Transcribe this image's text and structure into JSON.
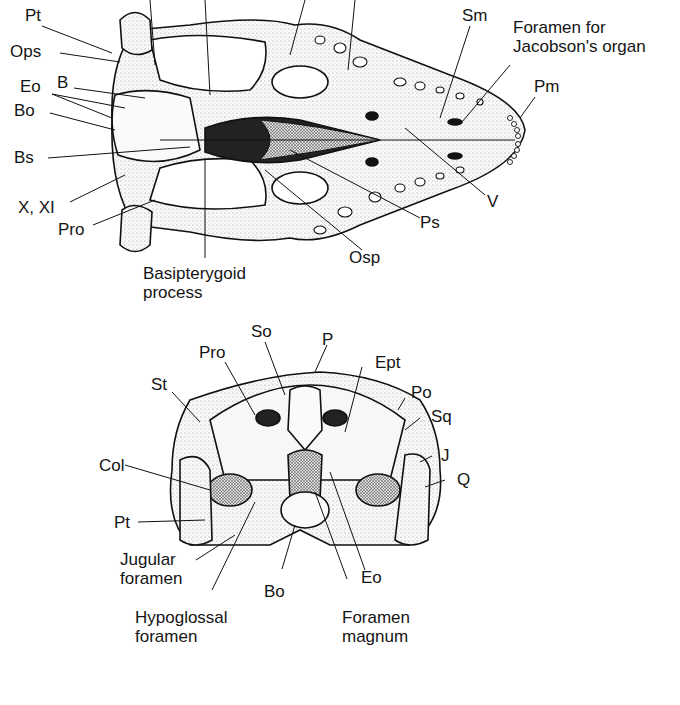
{
  "figure": {
    "ventral_view": {
      "labels": {
        "pt": "Pt",
        "ops": "Ops",
        "eo": "Eo",
        "b": "B",
        "bo": "Bo",
        "bs": "Bs",
        "x_xi": "X, XI",
        "pro": "Pro",
        "basipterygoid": "Basipterygoid\nprocess",
        "osp": "Osp",
        "ps": "Ps",
        "v": "V",
        "sm": "Sm",
        "jacobson": "Foramen for\nJacobson's organ",
        "pm": "Pm"
      }
    },
    "posterior_view": {
      "labels": {
        "so": "So",
        "p": "P",
        "pro": "Pro",
        "ept": "Ept",
        "st": "St",
        "po": "Po",
        "sq": "Sq",
        "j": "J",
        "col": "Col",
        "q": "Q",
        "pt": "Pt",
        "jugular": "Jugular\nforamen",
        "bo": "Bo",
        "eo": "Eo",
        "hypoglossal": "Hypoglossal\nforamen",
        "foramen_magnum": "Foramen\nmagnum"
      }
    }
  }
}
